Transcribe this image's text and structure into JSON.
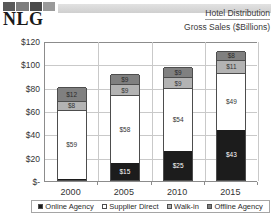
{
  "header": {
    "logo_text": "NLG",
    "logo_strip_name": "nlg-photo-strip",
    "title_line1": "Hotel Distribution",
    "title_line2": "Gross Sales ($Billions)"
  },
  "legend": {
    "items": [
      {
        "label": "Online Agency",
        "key": "online",
        "color": "#1c1c1c"
      },
      {
        "label": "Supplier Direct",
        "key": "supplier",
        "color": "#ffffff"
      },
      {
        "label": "Walk-in",
        "key": "walkin",
        "color": "#b3b3b3"
      },
      {
        "label": "Offline Agency",
        "key": "offline",
        "color": "#808080"
      }
    ]
  },
  "chart_data": {
    "type": "bar",
    "subtype": "stacked-column",
    "title": "Hotel Distribution",
    "subtitle": "Gross Sales ($Billions)",
    "xlabel": "",
    "ylabel": "Gross Sales ($Billions)",
    "ylim": [
      0,
      120
    ],
    "yticks": [
      0,
      20,
      40,
      60,
      80,
      100,
      120
    ],
    "ytick_labels": [
      "$-",
      "$20",
      "$40",
      "$60",
      "$80",
      "$100",
      "$120"
    ],
    "grid": true,
    "legend_position": "bottom",
    "categories": [
      "2000",
      "2005",
      "2010",
      "2015"
    ],
    "series": [
      {
        "name": "Online Agency",
        "color": "#1c1c1c",
        "values": [
          1,
          15,
          25,
          43
        ],
        "labels": [
          "",
          "$15",
          "$25",
          "$43"
        ]
      },
      {
        "name": "Supplier Direct",
        "color": "#ffffff",
        "values": [
          59,
          58,
          54,
          49
        ],
        "labels": [
          "$59",
          "$58",
          "$54",
          "$49"
        ]
      },
      {
        "name": "Walk-in",
        "color": "#b3b3b3",
        "values": [
          8,
          9,
          9,
          11
        ],
        "labels": [
          "$8",
          "$9",
          "$9",
          "$11"
        ]
      },
      {
        "name": "Offline Agency",
        "color": "#808080",
        "values": [
          12,
          9,
          9,
          8
        ],
        "labels": [
          "$12",
          "$9",
          "$9",
          "$8"
        ]
      }
    ],
    "totals": [
      80,
      91,
      97,
      111
    ]
  }
}
